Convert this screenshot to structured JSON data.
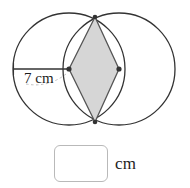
{
  "figure": {
    "caption_hidden": "",
    "radius_label": "7 cm",
    "colors": {
      "stroke": "#333333",
      "shade_fill": "#d6d6d6",
      "shade_stroke": "#555555",
      "leader_dash": "#b0b0b0",
      "box_border": "#b9b9b9",
      "text": "#1d1d1d"
    },
    "circles": [
      {
        "name": "left-circle",
        "cx": 69,
        "cy": 69,
        "r": 56
      },
      {
        "name": "right-circle",
        "cx": 119,
        "cy": 69,
        "r": 56
      }
    ],
    "rhombus": {
      "name": "shaded-rhombus",
      "vertices": [
        {
          "x": 69,
          "y": 69
        },
        {
          "x": 95,
          "y": 17
        },
        {
          "x": 119,
          "y": 69
        },
        {
          "x": 95,
          "y": 122
        }
      ]
    },
    "radius_segment": {
      "x1": 13,
      "y1": 69,
      "x2": 69,
      "y2": 69
    },
    "vertex_dots": [
      {
        "x": 69,
        "y": 69
      },
      {
        "x": 119,
        "y": 69
      },
      {
        "x": 95,
        "y": 17
      },
      {
        "x": 95,
        "y": 122
      }
    ]
  },
  "answer": {
    "value": "",
    "placeholder": "",
    "unit": "cm"
  }
}
